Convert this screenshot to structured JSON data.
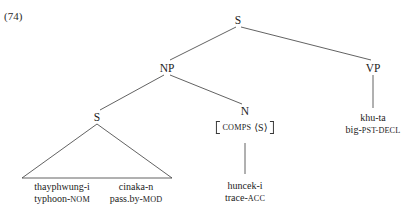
{
  "figure": {
    "example_number": "(74)",
    "clipped_text_above": ""
  },
  "tree": {
    "nodes": [
      {
        "id": "S-root",
        "label": "S",
        "x": 238,
        "y": 20
      },
      {
        "id": "NP",
        "label": "NP",
        "x": 167,
        "y": 68
      },
      {
        "id": "VP",
        "label": "VP",
        "x": 373,
        "y": 68
      },
      {
        "id": "S-rel",
        "label": "S",
        "x": 97,
        "y": 117
      },
      {
        "id": "N",
        "label": "N",
        "x": 245,
        "y": 111
      }
    ],
    "feature_matrix": {
      "id": "N-comps",
      "feature": "COMPS",
      "value": "⟨S⟩",
      "x": 245,
      "y": 120
    },
    "leaves": [
      {
        "id": "leaf-thayphwung",
        "form": "thayphwung-i",
        "gloss_stem": "typhoon-",
        "gloss_sc": "NOM",
        "x": 62,
        "y": 183
      },
      {
        "id": "leaf-cinaka",
        "form": "cinaka-n",
        "gloss_stem": "pass.by-",
        "gloss_sc": "MOD",
        "x": 136,
        "y": 183
      },
      {
        "id": "leaf-huncek",
        "form": "huncek-i",
        "gloss_stem": "trace-",
        "gloss_sc": "ACC",
        "x": 245,
        "y": 182
      },
      {
        "id": "leaf-khuta",
        "form": "khu-ta",
        "gloss_stem": "big-",
        "gloss_sc": "PST-DECL",
        "x": 373,
        "y": 115
      }
    ]
  },
  "style": {
    "line_color": "#3a3a3a",
    "text_color": "#1c1c1c",
    "background": "#ffffff"
  }
}
